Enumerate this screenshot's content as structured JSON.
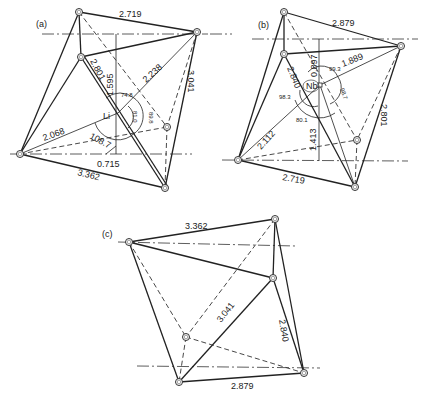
{
  "panels": [
    {
      "id": "a",
      "label": "(a)",
      "center_atom": "Li",
      "edge_lengths": [
        "2.719",
        "2.238",
        "3.041",
        "2.801",
        "2.068",
        "3.362"
      ],
      "distances": [
        "1.595",
        "0.715"
      ],
      "angles": [
        "74.8",
        "89.8",
        "81.0",
        "108.7"
      ]
    },
    {
      "id": "b",
      "label": "(b)",
      "center_atom": "Nb",
      "edge_lengths": [
        "2.879",
        "1.889",
        "2.801",
        "2.840",
        "2.112",
        "2.719"
      ],
      "distances": [
        "0.897",
        "1.413"
      ],
      "angles": [
        "99.3",
        "98.7",
        "98.3",
        "80.1"
      ]
    },
    {
      "id": "c",
      "label": "(c)",
      "edge_lengths": [
        "3.362",
        "3.041",
        "2.840",
        "2.879"
      ]
    }
  ]
}
